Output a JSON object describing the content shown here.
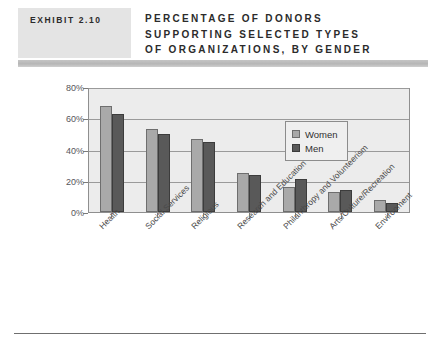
{
  "header": {
    "exhibit_label": "EXHIBIT 2.10",
    "title_lines": [
      "PERCENTAGE OF DONORS",
      "SUPPORTING SELECTED TYPES",
      "OF ORGANIZATIONS, BY GENDER"
    ]
  },
  "colors": {
    "women_fill": "#a9a9a9",
    "women_border": "#6e6e6e",
    "men_fill": "#595959",
    "men_border": "#3c3c3c",
    "plot_background": "#ececec",
    "gridline": "#9a9a9a",
    "exhibit_box": "#e4e4e4",
    "header_band": "#b6b6b6"
  },
  "chart_data": {
    "type": "bar",
    "title": "PERCENTAGE OF DONORS SUPPORTING SELECTED TYPES OF ORGANIZATIONS, BY GENDER",
    "xlabel": "",
    "ylabel": "",
    "ylim": [
      0,
      80
    ],
    "yticks": [
      0,
      20,
      40,
      60,
      80
    ],
    "ytick_labels": [
      "0%",
      "20%",
      "40%",
      "60%",
      "80%"
    ],
    "grid": true,
    "legend_position": "upper right inside",
    "categories": [
      "Health",
      "Social Services",
      "Religious",
      "Research and Education",
      "Philanthropy and Volunteerism",
      "Arts/Culture/Recreation",
      "Environment"
    ],
    "series": [
      {
        "name": "Women",
        "values": [
          68,
          53,
          47,
          25,
          16,
          13,
          8
        ]
      },
      {
        "name": "Men",
        "values": [
          63,
          50,
          45,
          24,
          21,
          14,
          6
        ]
      }
    ]
  }
}
